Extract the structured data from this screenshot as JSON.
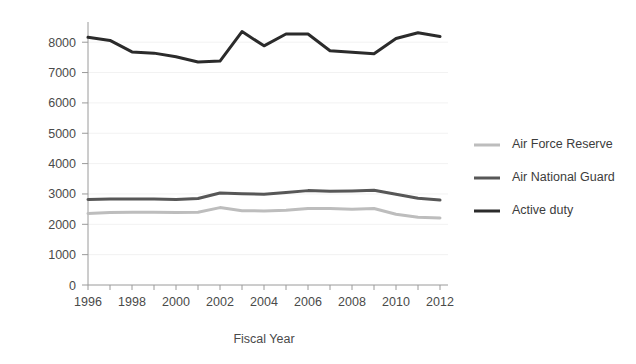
{
  "chart_data": {
    "type": "line",
    "title": "",
    "xlabel": "Fiscal Year",
    "ylabel": "",
    "x": [
      1996,
      1997,
      1998,
      1999,
      2000,
      2001,
      2002,
      2003,
      2004,
      2005,
      2006,
      2007,
      2008,
      2009,
      2010,
      2011,
      2012
    ],
    "xlim": [
      1996,
      2012
    ],
    "ylim": [
      0,
      8600
    ],
    "x_tick_labels": [
      "1996",
      "1998",
      "2000",
      "2002",
      "2004",
      "2006",
      "2008",
      "2010",
      "2012"
    ],
    "x_tick_values": [
      1996,
      1998,
      2000,
      2002,
      2004,
      2006,
      2008,
      2010,
      2012
    ],
    "x_minor_tick_values": [
      1997,
      1999,
      2001,
      2003,
      2005,
      2007,
      2009,
      2011
    ],
    "y_tick_labels": [
      "0",
      "1000",
      "2000",
      "3000",
      "4000",
      "5000",
      "6000",
      "7000",
      "8000"
    ],
    "y_tick_values": [
      0,
      1000,
      2000,
      3000,
      4000,
      5000,
      6000,
      7000,
      8000
    ],
    "grid": true,
    "legend_position": "right",
    "series": [
      {
        "name": "Air Force Reserve",
        "color": "#bdbdbd",
        "width": 3,
        "values": [
          2360,
          2390,
          2400,
          2400,
          2390,
          2400,
          2550,
          2450,
          2440,
          2460,
          2520,
          2520,
          2500,
          2520,
          2330,
          2230,
          2210
        ]
      },
      {
        "name": "Air National Guard",
        "color": "#575757",
        "width": 3,
        "values": [
          2820,
          2830,
          2830,
          2830,
          2820,
          2850,
          3030,
          3010,
          2990,
          3050,
          3110,
          3090,
          3100,
          3120,
          2990,
          2860,
          2800
        ]
      },
      {
        "name": "Active duty",
        "color": "#2b2b2b",
        "width": 3,
        "values": [
          8160,
          8060,
          7680,
          7640,
          7520,
          7350,
          7380,
          8350,
          7880,
          8270,
          8270,
          7720,
          7670,
          7620,
          8120,
          8310,
          8190
        ]
      }
    ]
  },
  "legend": {
    "items": [
      {
        "label": "Air Force Reserve"
      },
      {
        "label": "Air National Guard"
      },
      {
        "label": "Active duty"
      }
    ]
  },
  "axes": {
    "x_title": "Fiscal Year"
  }
}
